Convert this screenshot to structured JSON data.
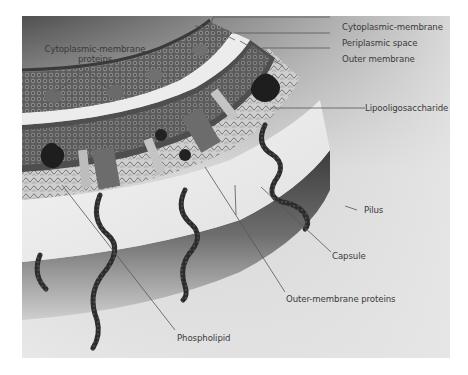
{
  "figure": {
    "style": "grayscale 3D illustration",
    "colors": {
      "page_background": "#ffffff",
      "panel_top": "#5a5a5a",
      "panel_background": "#e4e4e4",
      "label_text": "#3a3a3a",
      "leader_line": "#555555",
      "pilus": "#2a2a2a"
    }
  },
  "labels": {
    "cytoplasmic_membrane_proteins_line1": "Cytoplasmic-membrane",
    "cytoplasmic_membrane_proteins_line2": "proteins",
    "cytoplasmic_membrane": "Cytoplasmic-membrane",
    "periplasmic_space": "Periplasmic space",
    "outer_membrane": "Outer membrane",
    "lipooligosaccharide": "Lipooligosaccharide",
    "pilus": "Pilus",
    "capsule": "Capsule",
    "outer_membrane_proteins": "Outer-membrane proteins",
    "phospholipid": "Phospholipid"
  }
}
